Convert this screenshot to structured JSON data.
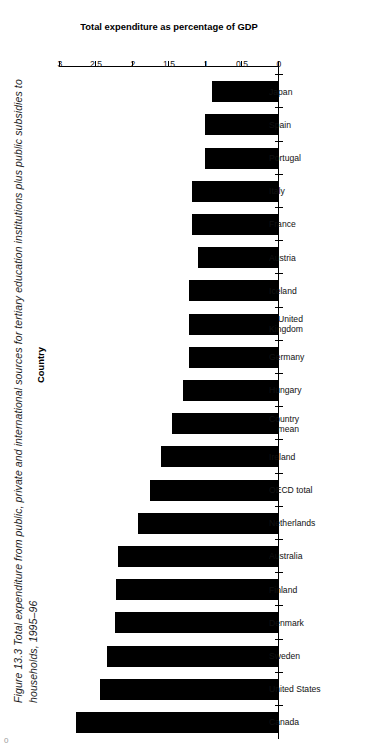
{
  "figure": {
    "caption": "Figure 13.3   Total expenditure from public, private and international sources for tertiary education institutions plus public subsidies to\nhouseholds, 1995–96",
    "page_number": "0"
  },
  "chart_data": {
    "type": "bar",
    "orientation": "horizontal",
    "title": "Total expenditure from public, private and international sources for tertiary education institutions plus public subsidies to households, 1995–96",
    "xlabel": "Country",
    "ylabel": "Total expenditure as percentage of GDP",
    "ylim": [
      0,
      3
    ],
    "yticks": [
      0,
      0.5,
      1,
      1.5,
      2,
      2.5,
      3
    ],
    "ytick_labels": [
      "0",
      "0.5",
      "1",
      "1.5",
      "2",
      "2.5",
      "3"
    ],
    "grid": false,
    "legend": false,
    "axis_reversed": true,
    "bar_color": "#000000",
    "categories": [
      "Canada",
      "United States",
      "Sweden",
      "Denmark",
      "Finland",
      "Australia",
      "Netherlands",
      "OECD total",
      "Ireland",
      "Country\nmean",
      "Hungary",
      "Germany",
      "United\nKingdom",
      "Iceland",
      "Austria",
      "France",
      "Italy",
      "Portugal",
      "Spain",
      "Japan"
    ],
    "values": [
      2.78,
      2.45,
      2.35,
      2.25,
      2.23,
      2.2,
      1.93,
      1.77,
      1.62,
      1.47,
      1.32,
      1.23,
      1.23,
      1.23,
      1.11,
      1.19,
      1.19,
      1.01,
      1.01,
      0.92
    ]
  }
}
